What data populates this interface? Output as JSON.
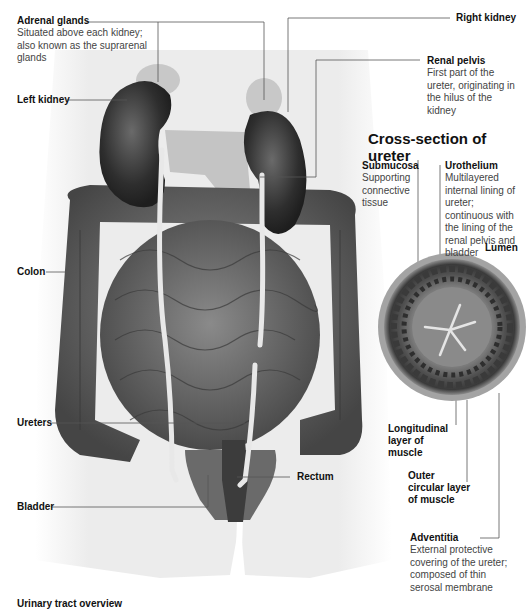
{
  "diagram": {
    "cross_section_title": "Cross-section of ureter",
    "clipped_footer_text": "Urinary tract overview",
    "labels": {
      "adrenal_glands": {
        "name": "Adrenal glands",
        "desc": "Situated above each kidney; also known as the suprarenal glands"
      },
      "left_kidney": {
        "name": "Left kidney"
      },
      "right_kidney": {
        "name": "Right kidney"
      },
      "renal_pelvis": {
        "name": "Renal pelvis",
        "desc": "First part of the ureter, originating in the hilus of the kidney"
      },
      "colon": {
        "name": "Colon"
      },
      "ureters": {
        "name": "Ureters"
      },
      "rectum": {
        "name": "Rectum"
      },
      "bladder": {
        "name": "Bladder"
      },
      "submucosa": {
        "name": "Submucosa",
        "desc": "Supporting connective tissue"
      },
      "urothelium": {
        "name": "Urothelium",
        "desc": "Multilayered internal lining of ureter; continuous with the lining of the renal pelvis and bladder"
      },
      "lumen": {
        "name": "Lumen"
      },
      "longitudinal": {
        "name": "Longitudinal layer of muscle"
      },
      "outer_circular": {
        "name": "Outer circular layer of muscle"
      },
      "adventitia": {
        "name": "Adventitia",
        "desc": "External protective covering of the ureter; composed of thin serosal membrane"
      }
    },
    "colors": {
      "body": "#ececec",
      "organ_dark": "#3a3a3a",
      "organ_mid": "#6e6e6e",
      "gland": "#c8c8c8",
      "ureter": "#e6e6e6",
      "leader_line": "#555555"
    }
  }
}
